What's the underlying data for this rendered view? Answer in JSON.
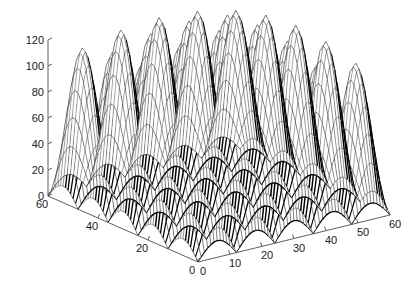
{
  "figure": {
    "width": 420,
    "height": 291,
    "background_color": "#ffffff",
    "plot_type": "3d-mesh-surface",
    "renderer_style": "matlab-mesh"
  },
  "chart_data": {
    "type": "surface",
    "subtype": "3d-mesh",
    "title": "",
    "xlabel": "",
    "ylabel": "",
    "zlabel": "",
    "grid": false,
    "legend": null,
    "view": {
      "azimuth_deg": -37.5,
      "elevation_deg": 30
    },
    "axes": {
      "x": {
        "label": "",
        "ticks": [
          0,
          10,
          20,
          30,
          40,
          50,
          60
        ],
        "tick_labels": [
          "0",
          "10",
          "20",
          "30",
          "40",
          "50",
          "60"
        ],
        "range": [
          0,
          60
        ]
      },
      "y": {
        "label": "",
        "ticks": [
          0,
          20,
          40,
          60
        ],
        "tick_labels": [
          "0",
          "20",
          "40",
          "60"
        ],
        "range": [
          0,
          60
        ]
      },
      "z": {
        "label": "",
        "ticks": [
          0,
          20,
          40,
          60,
          80,
          100,
          120
        ],
        "tick_labels": [
          "0",
          "20",
          "40",
          "60",
          "80",
          "100",
          "120"
        ],
        "range": [
          0,
          120
        ]
      }
    },
    "surface_function": {
      "description": "Product of sinusoids forming a grid of peaks, amplitude tapering toward the domain edges",
      "grid_size_x": 61,
      "grid_size_y": 61,
      "periods_x": 5,
      "periods_y": 5,
      "z_peak_max": 120,
      "z_valley_min": 0,
      "z_center_peak": 120,
      "z_edge_peak": 95
    },
    "mesh_style": {
      "line_color": "#000000",
      "face_color": "#ffffff",
      "shading": "none",
      "hidden_line_removal": true
    },
    "observed_peak_heights": [
      100,
      104,
      108,
      112,
      118,
      120,
      115,
      110,
      104,
      95
    ],
    "observed_valley_heights": [
      0,
      2,
      4,
      6,
      8,
      6,
      4,
      2,
      0
    ]
  },
  "axis_labels": {
    "z": [
      "120",
      "100",
      "80",
      "60",
      "40",
      "20",
      "0"
    ],
    "y": [
      "60",
      "40",
      "20",
      "0"
    ],
    "x": [
      "0",
      "10",
      "20",
      "30",
      "40",
      "50",
      "60"
    ]
  },
  "colors": {
    "background": "#ffffff",
    "axis": "#4d4d4d",
    "text": "#1a1a1a",
    "mesh": "#000000"
  }
}
